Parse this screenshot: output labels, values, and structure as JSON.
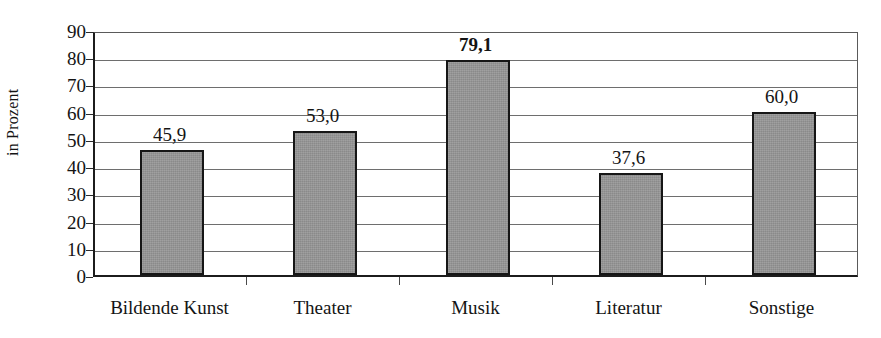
{
  "chart_data": {
    "type": "bar",
    "title": "",
    "subtitle": "",
    "xlabel": "",
    "ylabel": "in Prozent",
    "categories": [
      "Bildende Kunst",
      "Theater",
      "Musik",
      "Literatur",
      "Sonstige"
    ],
    "values": [
      45.9,
      53.0,
      79.1,
      37.6,
      60.0
    ],
    "value_labels": [
      "45,9",
      "53,0",
      "79,1",
      "37,6",
      "60,0"
    ],
    "emphasized_index": 2,
    "ylim": [
      0,
      90
    ],
    "ytick_step": 10,
    "ytick_labels": [
      "90",
      "80",
      "70",
      "60",
      "50",
      "40",
      "30",
      "20",
      "10",
      "0"
    ],
    "ytick_values": [
      90,
      80,
      70,
      60,
      50,
      40,
      30,
      20,
      10,
      0
    ],
    "grid": true,
    "grid_axis": "y",
    "legend": false,
    "legend_position": "none",
    "series": [
      {
        "name": "",
        "values": [
          45.9,
          53.0,
          79.1,
          37.6,
          60.0
        ]
      }
    ],
    "bar_color": "#969696",
    "bar_border_color": "#161616",
    "gridline_color": "#6e6e6e",
    "axis_color": "#1c1c1c",
    "text_color": "#141414",
    "background": "#ffffff"
  }
}
